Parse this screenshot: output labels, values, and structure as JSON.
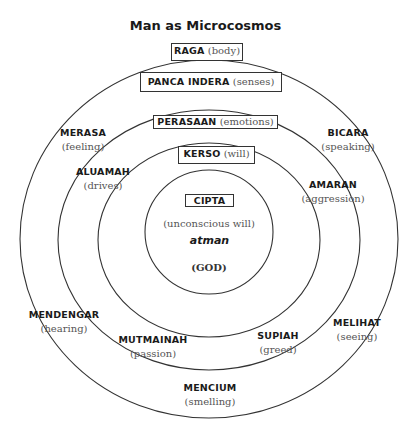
{
  "title": "Man as Microcosmos",
  "rings": [
    {
      "name": "raga",
      "term": "RAGA",
      "gloss": "(body)"
    },
    {
      "name": "panca-indera",
      "term": "PANCA INDERA",
      "gloss": "(senses)"
    },
    {
      "name": "perasaan",
      "term": "PERASAAN",
      "gloss": "(emotions)"
    },
    {
      "name": "kerso",
      "term": "KERSO",
      "gloss": "(will)"
    },
    {
      "name": "cipta",
      "term": "CIPTA",
      "gloss": ""
    }
  ],
  "core": {
    "subtitle": "(unconscious will)",
    "atman": "atman",
    "god": "(GOD)"
  },
  "senses": [
    {
      "term": "MERASA",
      "gloss": "(feeling)"
    },
    {
      "term": "BICARA",
      "gloss": "(speaking)"
    },
    {
      "term": "MENDENGAR",
      "gloss": "(hearing)"
    },
    {
      "term": "MELIHAT",
      "gloss": "(seeing)"
    },
    {
      "term": "MENCIUM",
      "gloss": "(smelling)"
    }
  ],
  "emotions": [
    {
      "term": "ALUAMAH",
      "gloss": "(drives)"
    },
    {
      "term": "AMARAN",
      "gloss": "(aggression)"
    },
    {
      "term": "MUTMAINAH",
      "gloss": "(passion)"
    },
    {
      "term": "SUPIAH",
      "gloss": "(greed)"
    }
  ]
}
